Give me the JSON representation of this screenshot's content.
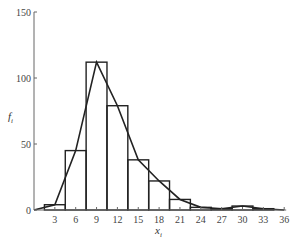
{
  "chart_data": {
    "type": "bar",
    "subtype": "histogram_with_frequency_polygon",
    "title": "",
    "xlabel": "x_i",
    "ylabel": "f_i",
    "xlabel_display": "x",
    "xlabel_sub": "i",
    "ylabel_display": "f",
    "ylabel_sub": "i",
    "xlim": [
      0,
      36
    ],
    "ylim": [
      0,
      150
    ],
    "x_ticks": [
      3,
      6,
      9,
      12,
      15,
      18,
      21,
      24,
      27,
      30,
      33,
      36
    ],
    "y_ticks": [
      0,
      50,
      100,
      150
    ],
    "grid": false,
    "legend": null,
    "bin_width": 3,
    "categories": [
      "1.5-4.5",
      "4.5-7.5",
      "7.5-10.5",
      "10.5-13.5",
      "13.5-16.5",
      "16.5-19.5",
      "19.5-22.5",
      "22.5-25.5",
      "25.5-28.5",
      "28.5-31.5",
      "31.5-34.5"
    ],
    "bin_edges": [
      1.5,
      4.5,
      7.5,
      10.5,
      13.5,
      16.5,
      19.5,
      22.5,
      25.5,
      28.5,
      31.5,
      34.5
    ],
    "values": [
      4,
      45,
      112,
      79,
      38,
      22,
      8,
      2,
      1,
      3,
      1
    ],
    "polygon": {
      "x": [
        0,
        3,
        6,
        9,
        12,
        15,
        18,
        21,
        24,
        27,
        30,
        33,
        36
      ],
      "y": [
        0,
        4,
        45,
        112,
        79,
        38,
        22,
        8,
        2,
        1,
        3,
        1,
        0
      ]
    }
  }
}
